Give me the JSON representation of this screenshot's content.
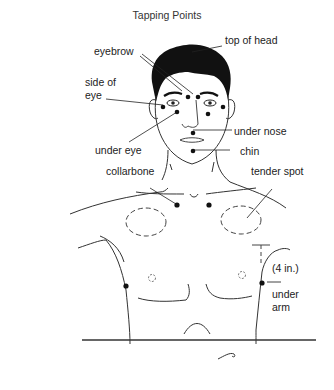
{
  "title": "Tapping Points",
  "labels": {
    "top_of_head": "top of head",
    "eyebrow": "eyebrow",
    "side_of_eye_1": "side of",
    "side_of_eye_2": "eye",
    "under_nose": "under nose",
    "chin": "chin",
    "under_eye": "under eye",
    "collarbone": "collarbone",
    "tender_spot": "tender spot",
    "four_in": "(4 in.)",
    "under_arm_1": "under",
    "under_arm_2": "arm"
  },
  "colors": {
    "ink": "#111111",
    "line": "#444444",
    "background": "#ffffff"
  }
}
